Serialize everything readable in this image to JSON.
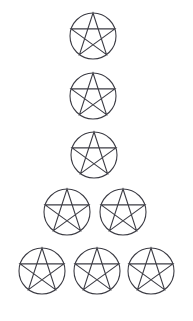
{
  "canvas": {
    "width": 193,
    "height": 321,
    "background_color": "#ffffff",
    "title": "Pentacle arrangement"
  },
  "style": {
    "line_color": "#3c3c44",
    "circle_stroke_width": 1.1,
    "star_stroke_width": 1.1,
    "fill": "none"
  },
  "figure": {
    "symbol_name": "pentacle",
    "symbol_description": "circle with inscribed upright five-pointed star (pentagram)",
    "count_total": 8,
    "arrangement": "pyramid",
    "rows_counts": [
      1,
      1,
      1,
      2,
      3
    ],
    "radius": 23,
    "star_point_up": true
  },
  "shapes": [
    {
      "id": "pentacle-1",
      "row": 1,
      "index_in_row": 1,
      "cx": 93,
      "cy": 36,
      "r": 23
    },
    {
      "id": "pentacle-2",
      "row": 2,
      "index_in_row": 1,
      "cx": 93,
      "cy": 96,
      "r": 23
    },
    {
      "id": "pentacle-3",
      "row": 3,
      "index_in_row": 1,
      "cx": 94,
      "cy": 155,
      "r": 23
    },
    {
      "id": "pentacle-4",
      "row": 4,
      "index_in_row": 1,
      "cx": 67,
      "cy": 212,
      "r": 23
    },
    {
      "id": "pentacle-5",
      "row": 4,
      "index_in_row": 2,
      "cx": 123,
      "cy": 212,
      "r": 23
    },
    {
      "id": "pentacle-6",
      "row": 5,
      "index_in_row": 1,
      "cx": 42,
      "cy": 271,
      "r": 23
    },
    {
      "id": "pentacle-7",
      "row": 5,
      "index_in_row": 2,
      "cx": 97,
      "cy": 271,
      "r": 23
    },
    {
      "id": "pentacle-8",
      "row": 5,
      "index_in_row": 3,
      "cx": 151,
      "cy": 271,
      "r": 23
    }
  ]
}
